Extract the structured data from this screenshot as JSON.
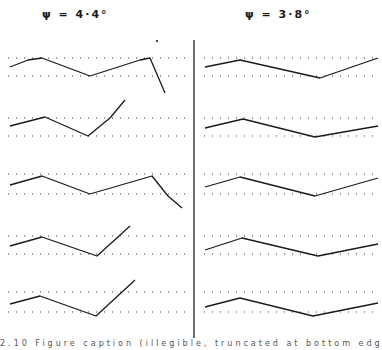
{
  "titles": {
    "left": "ψ = 4·4°",
    "right": "ψ = 3·8°"
  },
  "caption": "2.10  Figure caption (illegible, truncated at bottom edge)",
  "colors": {
    "line": "#1a1a1a",
    "dots": "#333333",
    "divider": "#222222"
  },
  "chart_data": {
    "type": "line",
    "title": "",
    "layout": "two columns of five stacked traces, each trace between two dotted reference lines",
    "columns": [
      {
        "label": "ψ = 4·4°",
        "traces": [
          {
            "ref_y": [
              58,
              76
            ],
            "points": [
              [
                10,
                67
              ],
              [
                28,
                60
              ],
              [
                42,
                58
              ],
              [
                90,
                76
              ],
              [
                140,
                60
              ],
              [
                150,
                58
              ],
              [
                165,
                93
              ]
            ]
          },
          {
            "ref_y": [
              118,
              136
            ],
            "points": [
              [
                10,
                126
              ],
              [
                45,
                117
              ],
              [
                88,
                136
              ],
              [
                110,
                118
              ],
              [
                125,
                100
              ]
            ]
          },
          {
            "ref_y": [
              174,
              194
            ],
            "points": [
              [
                10,
                185
              ],
              [
                42,
                176
              ],
              [
                90,
                194
              ],
              [
                152,
                176
              ],
              [
                168,
                196
              ],
              [
                182,
                208
              ]
            ]
          },
          {
            "ref_y": [
              236,
              254
            ],
            "points": [
              [
                10,
                246
              ],
              [
                42,
                237
              ],
              [
                97,
                256
              ],
              [
                130,
                226
              ]
            ]
          },
          {
            "ref_y": [
              292,
              312
            ],
            "points": [
              [
                10,
                304
              ],
              [
                40,
                296
              ],
              [
                96,
                316
              ],
              [
                135,
                280
              ]
            ]
          }
        ]
      },
      {
        "label": "ψ = 3·8°",
        "traces": [
          {
            "ref_y": [
              58,
              76
            ],
            "points": [
              [
                205,
                67
              ],
              [
                240,
                60
              ],
              [
                320,
                78
              ],
              [
                378,
                58
              ]
            ]
          },
          {
            "ref_y": [
              118,
              136
            ],
            "points": [
              [
                205,
                128
              ],
              [
                243,
                119
              ],
              [
                315,
                137
              ],
              [
                378,
                126
              ]
            ]
          },
          {
            "ref_y": [
              174,
              194
            ],
            "points": [
              [
                205,
                187
              ],
              [
                240,
                177
              ],
              [
                315,
                196
              ],
              [
                378,
                178
              ]
            ]
          },
          {
            "ref_y": [
              236,
              254
            ],
            "points": [
              [
                205,
                250
              ],
              [
                242,
                238
              ],
              [
                318,
                256
              ],
              [
                378,
                244
              ]
            ]
          },
          {
            "ref_y": [
              292,
              312
            ],
            "points": [
              [
                205,
                307
              ],
              [
                240,
                298
              ],
              [
                313,
                316
              ],
              [
                378,
                303
              ]
            ]
          }
        ]
      }
    ],
    "divider_x": 194,
    "xlabel": "",
    "ylabel": ""
  }
}
